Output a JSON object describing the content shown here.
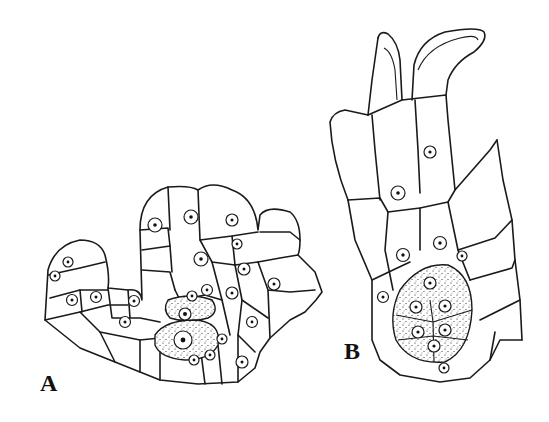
{
  "figure": {
    "panels": [
      {
        "id": "A",
        "label": "A",
        "description": "Cellular section with stippled central cells (archegonium initial stage)"
      },
      {
        "id": "B",
        "label": "B",
        "description": "Elongated organ with two apical lobes and stippled egg-cell cluster at base"
      }
    ]
  }
}
